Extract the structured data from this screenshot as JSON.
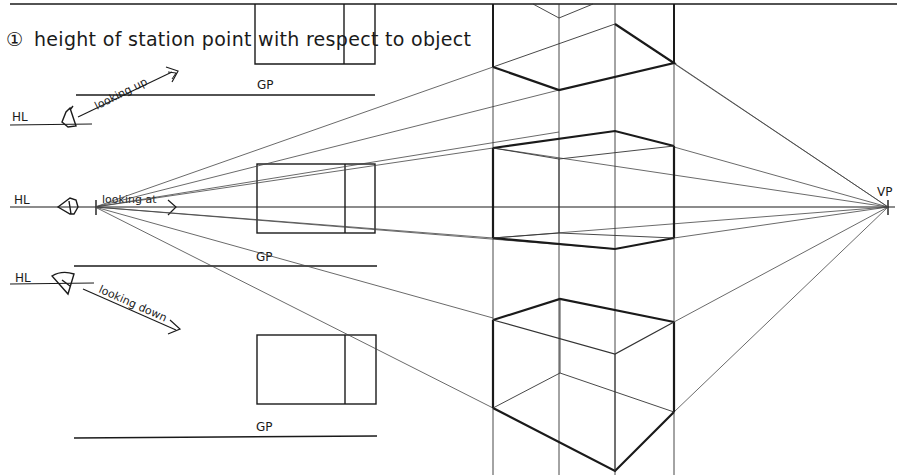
{
  "title": {
    "number": "①",
    "text": "height of station point with respect to object"
  },
  "labels": {
    "hl_top": "HL",
    "hl_middle": "HL",
    "hl_bottom": "HL",
    "gp_top": "GP",
    "gp_middle": "GP",
    "gp_bottom": "GP",
    "vp": "VP",
    "looking_up": "looking up",
    "looking_at": "looking at",
    "looking_down": "looking down"
  },
  "colors": {
    "ink": "#1a1a1a",
    "thin_ink": "#3a3a3a",
    "paper": "#ffffff"
  },
  "geometry": {
    "vanishing_point": [
      888,
      207
    ],
    "station_point": [
      95,
      207
    ],
    "horizon_y": 207
  }
}
